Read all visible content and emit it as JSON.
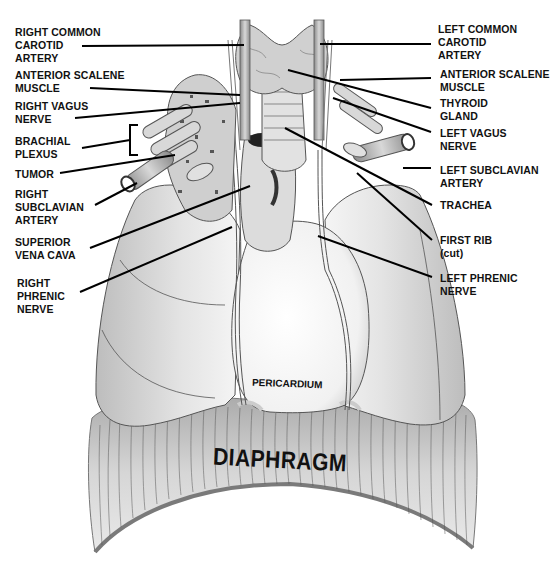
{
  "figure": {
    "type": "anatomical-diagram",
    "colors": {
      "background": "#ffffff",
      "label_text": "#111111",
      "leader_line": "#000000",
      "lung_fill": "#d9d9d9",
      "outline": "#555555",
      "diaphragm_fill": "#bdbdbd",
      "diaphragm_edge": "#7a7a7a",
      "pericardium_fill": "#f4f4f4"
    }
  },
  "labels": {
    "left_side": [
      {
        "id": "right-common-carotid-artery",
        "text": "RIGHT COMMON\nCAROTID\nARTERY"
      },
      {
        "id": "right-anterior-scalene-muscle",
        "text": "ANTERIOR SCALENE\nMUSCLE"
      },
      {
        "id": "right-vagus-nerve",
        "text": "RIGHT VAGUS\nNERVE"
      },
      {
        "id": "brachial-plexus",
        "text": "BRACHIAL\nPLEXUS"
      },
      {
        "id": "tumor",
        "text": "TUMOR"
      },
      {
        "id": "right-subclavian-artery",
        "text": "RIGHT\nSUBCLAVIAN\nARTERY"
      },
      {
        "id": "superior-vena-cava",
        "text": "SUPERIOR\nVENA CAVA"
      },
      {
        "id": "right-phrenic-nerve",
        "text": "RIGHT\nPHRENIC\nNERVE"
      }
    ],
    "right_side": [
      {
        "id": "left-common-carotid-artery",
        "text": "LEFT COMMON\nCAROTID\nARTERY"
      },
      {
        "id": "left-anterior-scalene-muscle",
        "text": "ANTERIOR SCALENE\nMUSCLE"
      },
      {
        "id": "thyroid-gland",
        "text": "THYROID\nGLAND"
      },
      {
        "id": "left-vagus-nerve",
        "text": "LEFT VAGUS\nNERVE"
      },
      {
        "id": "left-subclavian-artery",
        "text": "LEFT SUBCLAVIAN\nARTERY"
      },
      {
        "id": "trachea",
        "text": "TRACHEA"
      },
      {
        "id": "first-rib",
        "text": "FIRST RIB\n(cut)"
      },
      {
        "id": "left-phrenic-nerve",
        "text": "LEFT PHRENIC\nNERVE"
      }
    ],
    "in_figure": {
      "pericardium": "PERICARDIUM",
      "diaphragm": "DIAPHRAGM"
    }
  }
}
